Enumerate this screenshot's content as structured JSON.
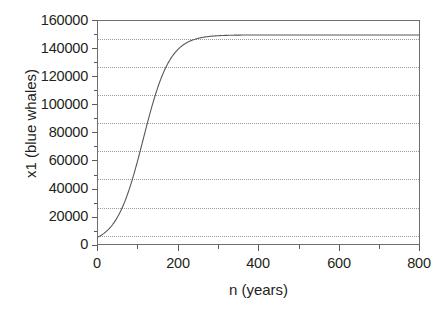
{
  "chart_data": {
    "type": "line",
    "title": "",
    "xlabel": "n (years)",
    "ylabel": "x1 (blue whales)",
    "xlim": [
      0,
      800
    ],
    "ylim": [
      0,
      160000
    ],
    "grid": true,
    "legend": null,
    "x_ticks": [
      0,
      200,
      400,
      600,
      800
    ],
    "x_tick_labels": [
      "0",
      "200",
      "400",
      "600",
      "800"
    ],
    "x_minor_ticks": [
      100,
      300,
      500,
      700
    ],
    "y_ticks": [
      0,
      20000,
      40000,
      60000,
      80000,
      100000,
      120000,
      140000,
      160000
    ],
    "y_tick_labels": [
      "0",
      "20000",
      "40000",
      "60000",
      "80000",
      "100000",
      "120000",
      "140000",
      "160000"
    ],
    "y_minor_ticks": [
      10000,
      30000,
      50000,
      70000,
      90000,
      110000,
      130000,
      150000
    ],
    "series": [
      {
        "name": "x1 (blue whales)",
        "color": "#58595b",
        "carrying_capacity": 150000,
        "initial_value": 5000,
        "x": [
          0,
          10,
          20,
          30,
          40,
          50,
          60,
          70,
          80,
          90,
          100,
          110,
          120,
          130,
          140,
          150,
          160,
          180,
          200,
          250,
          300,
          350,
          400,
          450,
          500,
          550,
          600,
          650,
          700,
          750,
          800
        ],
        "y": [
          5000,
          6600,
          8700,
          11400,
          14900,
          19400,
          25000,
          32000,
          40400,
          50400,
          61600,
          73800,
          86100,
          97800,
          108200,
          117000,
          124200,
          134500,
          140800,
          147200,
          149000,
          149600,
          149850,
          149940,
          149975,
          149990,
          149996,
          149998,
          149999,
          150000,
          150000
        ]
      }
    ]
  },
  "axes": {
    "y_title": "x1 (blue whales)",
    "x_title": "n (years)"
  }
}
